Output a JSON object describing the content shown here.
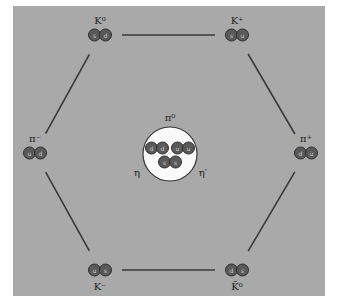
{
  "colors": {
    "background": "#a9a9a9",
    "quark": "#5a5a5a",
    "line": "#3a3a3a",
    "center_fill": "#fafafa"
  },
  "nodes": [
    {
      "id": "k0",
      "label": "K⁰",
      "quarks": [
        "s",
        "d"
      ],
      "pos": "top-left"
    },
    {
      "id": "k-plus",
      "label": "K⁺",
      "quarks": [
        "s",
        "u"
      ],
      "pos": "top-right"
    },
    {
      "id": "pi-minus",
      "label": "π⁻",
      "quarks": [
        "u",
        "d"
      ],
      "pos": "left"
    },
    {
      "id": "pi-plus",
      "label": "π⁺",
      "quarks": [
        "d",
        "u"
      ],
      "pos": "right"
    },
    {
      "id": "k-minus",
      "label": "K⁻",
      "quarks": [
        "u",
        "s"
      ],
      "pos": "bottom-left"
    },
    {
      "id": "k0-bar",
      "label": "K̄⁰",
      "quarks": [
        "d",
        "s"
      ],
      "pos": "bottom-right"
    }
  ],
  "edges": [
    [
      "k0",
      "k-plus"
    ],
    [
      "k-plus",
      "pi-plus"
    ],
    [
      "pi-plus",
      "k0-bar"
    ],
    [
      "k0-bar",
      "k-minus"
    ],
    [
      "k-minus",
      "pi-minus"
    ],
    [
      "pi-minus",
      "k0"
    ]
  ],
  "center": {
    "top_label": "π⁰",
    "left_label": "η",
    "right_label": "η′",
    "pairs": [
      [
        "d",
        "d"
      ],
      [
        "u",
        "u"
      ],
      [
        "s",
        "s"
      ]
    ]
  }
}
